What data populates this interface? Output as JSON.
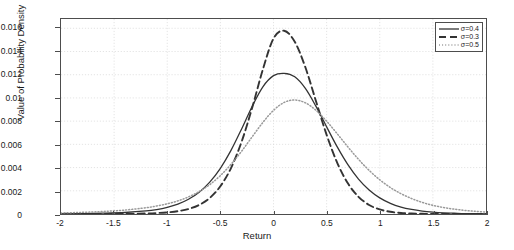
{
  "chart_data": {
    "type": "line",
    "title": "",
    "xlabel": "Return",
    "ylabel": "Value of Probability Density",
    "xlim": [
      -2,
      2
    ],
    "ylim": [
      0,
      0.0168
    ],
    "grid": true,
    "legend_position": "top-right",
    "xticks": [
      -2,
      -1.5,
      -1,
      -0.5,
      0,
      0.5,
      1,
      1.5,
      2
    ],
    "xtick_labels": [
      "-2",
      "-1.5",
      "-1",
      "-0.5",
      "0",
      "0.5",
      "1",
      "1.5",
      "2"
    ],
    "yticks": [
      0,
      0.002,
      0.004,
      0.006,
      0.008,
      0.01,
      0.012,
      0.014,
      0.016
    ],
    "ytick_labels": [
      "0",
      "0.002",
      "0.004",
      "0.006",
      "0.008",
      "0.01",
      "0.012",
      "0.014",
      "0.016"
    ],
    "series": [
      {
        "name": "σ=0.4",
        "style": "solid",
        "color": "#333333",
        "peak_x": 0.2,
        "peak_y": 0.0122,
        "x": [
          -2,
          -1.8,
          -1.6,
          -1.4,
          -1.2,
          -1.1,
          -1,
          -0.9,
          -0.8,
          -0.7,
          -0.6,
          -0.5,
          -0.4,
          -0.3,
          -0.2,
          -0.1,
          0,
          0.1,
          0.2,
          0.3,
          0.4,
          0.5,
          0.6,
          0.7,
          0.8,
          0.9,
          1,
          1.1,
          1.2,
          1.3,
          1.4,
          1.5,
          1.6,
          1.7,
          1.8,
          1.9,
          2
        ],
        "y": [
          2e-05,
          4e-05,
          7e-05,
          0.00013,
          0.00026,
          0.00038,
          0.00057,
          0.00085,
          0.00127,
          0.00188,
          0.00275,
          0.00394,
          0.00548,
          0.00733,
          0.00929,
          0.01096,
          0.01192,
          0.01212,
          0.01182,
          0.01082,
          0.00927,
          0.00751,
          0.00578,
          0.00425,
          0.00301,
          0.00207,
          0.00139,
          0.00092,
          0.0006,
          0.00039,
          0.00025,
          0.00016,
          0.0001,
          7e-05,
          4e-05,
          3e-05,
          2e-05
        ]
      },
      {
        "name": "σ=0.3",
        "style": "dashed",
        "color": "#333333",
        "peak_x": 0.15,
        "peak_y": 0.0158,
        "x": [
          -2,
          -1.8,
          -1.6,
          -1.4,
          -1.2,
          -1.1,
          -1,
          -0.9,
          -0.8,
          -0.7,
          -0.6,
          -0.5,
          -0.4,
          -0.3,
          -0.2,
          -0.1,
          0,
          0.1,
          0.2,
          0.3,
          0.4,
          0.5,
          0.6,
          0.7,
          0.8,
          0.9,
          1,
          1.1,
          1.2,
          1.3,
          1.4,
          1.5,
          1.6,
          1.7,
          1.8,
          1.9,
          2
        ],
        "y": [
          2e-06,
          4e-06,
          8e-06,
          2e-05,
          5e-05,
          8e-05,
          0.00014,
          0.00024,
          0.00043,
          0.00078,
          0.00138,
          0.00239,
          0.00396,
          0.00623,
          0.00918,
          0.01246,
          0.01512,
          0.01579,
          0.01484,
          0.01264,
          0.00972,
          0.00682,
          0.00441,
          0.00264,
          0.00148,
          0.00078,
          0.00039,
          0.00019,
          9e-05,
          4e-05,
          2e-05,
          1e-05,
          5e-06,
          3e-06,
          2e-06,
          1e-06,
          1e-06
        ]
      },
      {
        "name": "σ=0.5",
        "style": "dotted",
        "color": "#999999",
        "peak_x": 0.3,
        "peak_y": 0.0098,
        "x": [
          -2,
          -1.8,
          -1.6,
          -1.4,
          -1.2,
          -1.1,
          -1,
          -0.9,
          -0.8,
          -0.7,
          -0.6,
          -0.5,
          -0.4,
          -0.3,
          -0.2,
          -0.1,
          0,
          0.1,
          0.2,
          0.3,
          0.4,
          0.5,
          0.6,
          0.7,
          0.8,
          0.9,
          1,
          1.1,
          1.2,
          1.3,
          1.4,
          1.5,
          1.6,
          1.7,
          1.8,
          1.9,
          2
        ],
        "y": [
          9e-05,
          0.00014,
          0.00022,
          0.00034,
          0.00054,
          0.00069,
          0.00088,
          0.00113,
          0.00147,
          0.00193,
          0.00253,
          0.00331,
          0.00428,
          0.00541,
          0.00666,
          0.00789,
          0.00893,
          0.00961,
          0.00982,
          0.00958,
          0.00893,
          0.008,
          0.00691,
          0.00578,
          0.00471,
          0.00376,
          0.00295,
          0.00228,
          0.00175,
          0.00133,
          0.001,
          0.00075,
          0.00056,
          0.00042,
          0.00031,
          0.00023,
          0.00017
        ]
      }
    ]
  }
}
